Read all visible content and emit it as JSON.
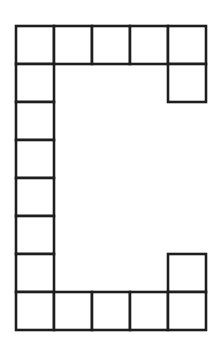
{
  "diagram": {
    "title": "",
    "cell_size": 38,
    "origin": [
      16,
      26
    ],
    "stroke_color": "#1e1e1e",
    "fill_color": "#ffffff",
    "cells": [
      {
        "col": 0,
        "row": 0
      },
      {
        "col": 1,
        "row": 0
      },
      {
        "col": 2,
        "row": 0
      },
      {
        "col": 3,
        "row": 0
      },
      {
        "col": 4,
        "row": 0
      },
      {
        "col": 4,
        "row": 1
      },
      {
        "col": 0,
        "row": 1
      },
      {
        "col": 0,
        "row": 2
      },
      {
        "col": 0,
        "row": 3
      },
      {
        "col": 0,
        "row": 4
      },
      {
        "col": 0,
        "row": 5
      },
      {
        "col": 0,
        "row": 6
      },
      {
        "col": 4,
        "row": 6
      },
      {
        "col": 0,
        "row": 7
      },
      {
        "col": 1,
        "row": 7
      },
      {
        "col": 2,
        "row": 7
      },
      {
        "col": 3,
        "row": 7
      },
      {
        "col": 4,
        "row": 7
      }
    ]
  }
}
